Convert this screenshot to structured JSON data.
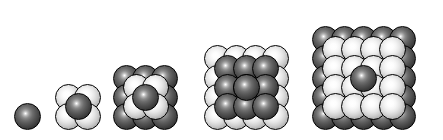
{
  "figure": {
    "background_color": "#ffffff",
    "canvas": {
      "width": 443,
      "height": 140
    },
    "baseline_y": 130
  },
  "style": {
    "dark_sphere_color": "#4a4a4a",
    "light_sphere_color": "#e6e6e6",
    "outline_color": "#000000",
    "highlight_color": "#ffffff",
    "sphere_diameter": 27,
    "grid_pitch": 19.2,
    "highlight_position": "42% 38%"
  },
  "clusters": [
    {
      "index": 1,
      "name": "cluster-1",
      "label": "n = 1",
      "order": 1,
      "back_grid": 1,
      "front_grid": 0,
      "back_color": "dark",
      "front_color": "light",
      "has_center_sphere": false,
      "sphere_count": 1,
      "left": 14,
      "bottom": 130,
      "diameter": 27
    },
    {
      "index": 2,
      "name": "cluster-2",
      "label": "n = 2",
      "order": 2,
      "back_grid": 2,
      "front_grid": 1,
      "back_color": "light",
      "front_color": "dark",
      "has_center_sphere": false,
      "sphere_count": 5,
      "left": 55,
      "bottom": 130,
      "diameter": 27
    },
    {
      "index": 3,
      "name": "cluster-3",
      "label": "n = 3",
      "order": 3,
      "back_grid": 3,
      "front_grid": 2,
      "back_color": "dark",
      "front_color": "light",
      "has_center_sphere": true,
      "center_color": "dark",
      "sphere_count": 14,
      "left": 113,
      "bottom": 130,
      "diameter": 27
    },
    {
      "index": 4,
      "name": "cluster-4",
      "label": "n = 4",
      "order": 4,
      "back_grid": 4,
      "front_grid": 3,
      "back_color": "light",
      "front_color": "dark",
      "has_center_sphere": true,
      "center_color": "dark",
      "sphere_count": 26,
      "left": 204,
      "bottom": 130,
      "diameter": 27
    },
    {
      "index": 5,
      "name": "cluster-5",
      "label": "n = 5",
      "order": 5,
      "back_grid": 5,
      "front_grid": 4,
      "back_color": "dark",
      "front_color": "light",
      "has_center_sphere": true,
      "center_color": "dark",
      "sphere_count": 42,
      "left": 312,
      "bottom": 130,
      "diameter": 27
    }
  ]
}
